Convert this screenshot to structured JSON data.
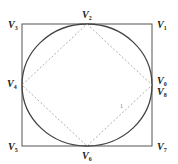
{
  "diagram": {
    "type": "geometry",
    "colors": {
      "square": "#555555",
      "circle": "#444444",
      "diamond": "#9a9a9a",
      "text": "#222222"
    },
    "square": {
      "x1": 22,
      "y1": 24,
      "x2": 152,
      "y2": 146
    },
    "circle": {
      "cx": 87,
      "cy": 85,
      "rx": 65,
      "ry": 61
    },
    "labels": [
      {
        "id": "V3",
        "base": "V",
        "sub": "3",
        "x": 8,
        "y": 20
      },
      {
        "id": "V2",
        "base": "V",
        "sub": "2",
        "x": 82,
        "y": 10
      },
      {
        "id": "V1",
        "base": "V",
        "sub": "1",
        "x": 157,
        "y": 20
      },
      {
        "id": "V4",
        "base": "V",
        "sub": "4",
        "x": 7,
        "y": 79
      },
      {
        "id": "V0",
        "base": "V",
        "sub": "0",
        "x": 157,
        "y": 77
      },
      {
        "id": "V8",
        "base": "V",
        "sub": "8",
        "x": 157,
        "y": 87
      },
      {
        "id": "V5",
        "base": "V",
        "sub": "5",
        "x": 8,
        "y": 142
      },
      {
        "id": "V6",
        "base": "V",
        "sub": "6",
        "x": 82,
        "y": 151
      },
      {
        "id": "V7",
        "base": "V",
        "sub": "7",
        "x": 157,
        "y": 142
      }
    ],
    "marker": {
      "text": "1",
      "x": 120,
      "y": 103
    }
  }
}
